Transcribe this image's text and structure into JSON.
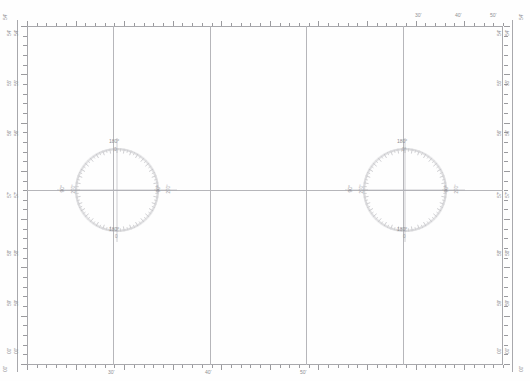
{
  "chart_data": {
    "type": "scatter",
    "title": "",
    "subtitle": "",
    "xlabel": "",
    "ylabel": "",
    "grid": true,
    "legend": false,
    "x": [
      113,
      210,
      306,
      403
    ],
    "y": [
      190
    ],
    "xlim": [
      27,
      503
    ],
    "ylim": [
      26,
      365
    ],
    "series": [
      {
        "name": "compass-roses",
        "points": [
          {
            "cx": 117,
            "cy": 190,
            "r": 42
          },
          {
            "cx": 405,
            "cy": 190,
            "r": 42
          }
        ]
      }
    ],
    "meridians": [
      "30'",
      "40'",
      "50'"
    ],
    "parallels": [
      "54'",
      "55'",
      "56'",
      "57'",
      "58'",
      "59'",
      "00'"
    ]
  },
  "frame": {
    "border_color": "#a8a8ac",
    "grid_color": "#b6b6ba",
    "tick_color": "#9a9a9e",
    "text_color": "#8e8e93",
    "background": "#fefefe"
  },
  "margins": {
    "left_labels": [
      {
        "value": "54'",
        "pair": "54'",
        "y": 22
      },
      {
        "value": "55'",
        "pair": "55'",
        "y": 72
      },
      {
        "value": "56'",
        "pair": "56'",
        "y": 122
      },
      {
        "value": "57'",
        "pair": "57'",
        "y": 184
      },
      {
        "value": "58'",
        "pair": "58'",
        "y": 242
      },
      {
        "value": "59'",
        "pair": "59'",
        "y": 292
      },
      {
        "value": "00'",
        "pair": "00'",
        "y": 340
      }
    ],
    "right_labels": [
      {
        "value": "54'",
        "pair": "54'",
        "y": 22
      },
      {
        "value": "55'",
        "pair": "55'",
        "y": 72
      },
      {
        "value": "56'",
        "pair": "56'",
        "y": 122
      },
      {
        "value": "57'",
        "pair": "57'",
        "y": 184
      },
      {
        "value": "58'",
        "pair": "58'",
        "y": 242
      },
      {
        "value": "59'",
        "pair": "59'",
        "y": 292
      },
      {
        "value": "00'",
        "pair": "00'",
        "y": 340
      }
    ],
    "bottom_labels": [
      {
        "value": "30'",
        "x": 108
      },
      {
        "value": "40'",
        "x": 205
      },
      {
        "value": "50'",
        "x": 300
      }
    ],
    "top_labels": [
      {
        "value": "30'",
        "x": 415
      },
      {
        "value": "40'",
        "x": 455
      },
      {
        "value": "50'",
        "x": 490
      }
    ],
    "corner_left_top": "54'",
    "corner_left_bottom": "00'",
    "corner_right_top": "54'",
    "corner_right_bottom": "00'"
  },
  "roses": [
    {
      "name": "compass-rose-left",
      "cx": 117,
      "cy": 190,
      "radius": 42,
      "ticks": 360,
      "labels": {
        "top_outer": "180°",
        "top_inner": "0",
        "bottom_outer": "180°",
        "bottom_inner": "0",
        "left_outer": "90°",
        "left_inner": "270°",
        "right_outer": "90°",
        "right_inner": "270°"
      }
    },
    {
      "name": "compass-rose-right",
      "cx": 405,
      "cy": 190,
      "radius": 42,
      "ticks": 360,
      "labels": {
        "top_outer": "180°",
        "top_inner": "0°",
        "bottom_outer": "180°",
        "bottom_inner": "0",
        "left_outer": "90°",
        "left_inner": "270°",
        "right_outer": "90°",
        "right_inner": "270°"
      }
    }
  ]
}
